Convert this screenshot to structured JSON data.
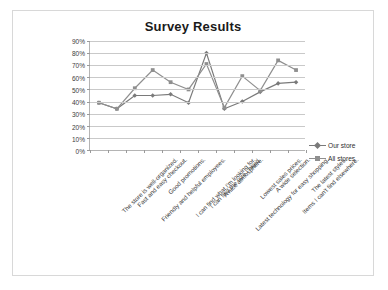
{
  "chart_data": {
    "type": "line",
    "title": "Survey Results",
    "xlabel": "",
    "ylabel": "",
    "ylim": [
      0,
      90
    ],
    "ytick_step": 10,
    "ytick_labels": [
      "90%",
      "80%",
      "70%",
      "60%",
      "50%",
      "40%",
      "30%",
      "20%",
      "10%",
      "0%"
    ],
    "grid": true,
    "legend_position": "right",
    "categories": [
      "The store is well-organized.",
      "Fast and easy checkout.",
      "Friendly and helpful employees.",
      "Good promotions.",
      "I can find what I'm looking for.",
      "I can find the size I need.",
      "A nice atmosphere.",
      "Latest technology for easy shopping.",
      "Lowest sales prices.",
      "A wide selection.",
      "Items I can't find elsewhere.",
      "The latest styles."
    ],
    "series": [
      {
        "name": "Our store",
        "marker": "diamond",
        "color": "#7a7a7a",
        "values": [
          39,
          34,
          45,
          45,
          46,
          39,
          80,
          34,
          40,
          48,
          55,
          56
        ]
      },
      {
        "name": "All stores",
        "marker": "square",
        "color": "#8f8f8f",
        "values": [
          39,
          34,
          51,
          66,
          56,
          50,
          71,
          35,
          61,
          49,
          74,
          66
        ]
      }
    ]
  },
  "colors": {
    "series_our_store": "#7a7a7a",
    "series_all_stores": "#8f8f8f",
    "gridline": "#c9c9c9",
    "axis": "#b4b4b4",
    "frame_border": "#d8d8d8",
    "title_text": "#1a1a1a",
    "tick_text": "#3c3c3c"
  }
}
